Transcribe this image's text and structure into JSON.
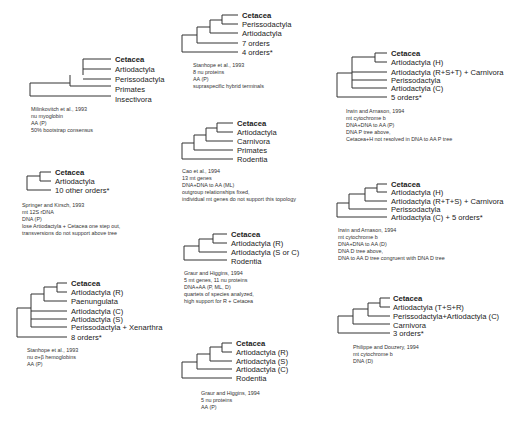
{
  "figure": {
    "panels": [
      {
        "id": "milinkovitch",
        "taxa": [
          "Cetacea",
          "Artiodactyla",
          "Perissodactyla",
          "Primates",
          "Insectivora"
        ],
        "caption": [
          "Milinkovitch et al., 1993",
          "nu myoglobin",
          "AA (P)",
          "50% bootstrap consensus"
        ]
      },
      {
        "id": "stanhope-8nu",
        "taxa": [
          "Cetacea",
          "Perissodactyla",
          "Artiodactyla",
          "7 orders",
          "4 orders*"
        ],
        "caption": [
          "Stanhope et al., 1993",
          "8 nu proteins",
          "AA (P)",
          "supraspecific hybrid terminals"
        ]
      },
      {
        "id": "irwin-arnason-p",
        "taxa": [
          "Cetacea",
          "Artiodactyla (H)",
          "Artiodactyla (R+S+T) + Carnivora",
          "Perissodactyla",
          "Artiodactyla (C)",
          "5 orders*"
        ],
        "caption": [
          "Irwin and Arnason, 1994",
          "mt cytochrome b",
          "DNA+DNA to AA (P)",
          "DNA P tree above,",
          "Cetacea+H not resolved in DNA to AA P tree"
        ]
      },
      {
        "id": "springer-kirsch",
        "taxa": [
          "Cetacea",
          "Artiodactyla",
          "10 other orders*"
        ],
        "caption": [
          "Springer and Kirsch, 1993",
          "mt 12S rDNA",
          "DNA (P)",
          "lose Artiodactyla + Cetacea one step out,",
          "transversions do not support above tree"
        ]
      },
      {
        "id": "cao",
        "taxa": [
          "Cetacea",
          "Artiodactyla",
          "Carnivora",
          "Primates",
          "Rodentia"
        ],
        "caption": [
          "Cao et al., 1994",
          "13  mt genes",
          "DNA+DNA to AA (ML)",
          "outgroup relationships fixed,",
          "individual mt genes do not support this topology"
        ]
      },
      {
        "id": "irwin-arnason-d",
        "taxa": [
          "Cetacea",
          "Artiodactyla (H)",
          "Artiodactyla (R+T+S) + Carnivora",
          "Perissodactyla",
          "Artiodactyla (C) + 5 orders*"
        ],
        "caption": [
          "Irwin and Arnason, 1994",
          "mt cytochrome b",
          "DNA+DNA to AA (D)",
          "DNA D tree above,",
          "DNA to AA D tree congruent with DNA D tree"
        ]
      },
      {
        "id": "graur-higgins-mt",
        "taxa": [
          "Cetacea",
          "Artiodactyla (R)",
          "Artiodactyla (S or C)",
          "Rodentia"
        ],
        "caption": [
          "Graur and Higgins, 1994",
          "5 mt genes, 11 nu proteins",
          "DNA+AA (P, ML, D)",
          "quartets of species analyzed,",
          "high support for R + Cetacea"
        ]
      },
      {
        "id": "stanhope-hemoglobin",
        "taxa": [
          "Cetacea",
          "Artiodactyla (R)",
          "Paenungulata",
          "Artiodactyla (C)",
          "Artiodactyla (S)",
          "Perissodactyla + Xenarthra",
          "8 orders*"
        ],
        "caption": [
          "Stanhope et al., 1993",
          "nu α+β hemoglobins",
          "AA (P)"
        ]
      },
      {
        "id": "philippe-douzery",
        "taxa": [
          "Cetacea",
          "Artiodactyla (T+S+R)",
          "Perissodactyla+Artiodactyla (C)",
          "Carnivora",
          "3 orders*"
        ],
        "caption": [
          "Philippe and Douzery, 1994",
          "mt cytochrome b",
          "DNA (D)"
        ]
      },
      {
        "id": "graur-higgins-nu",
        "taxa": [
          "Cetacea",
          "Artiodactyla (R)",
          "Artiodactyla (S)",
          "Artiodactyla (C)",
          "Rodentia"
        ],
        "caption": [
          "Graur and Higgins, 1994",
          "5 nu proteins",
          "AA (P)"
        ]
      }
    ]
  }
}
